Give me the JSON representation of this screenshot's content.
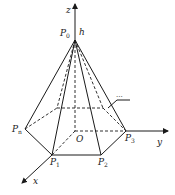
{
  "diagram": {
    "type": "3d-pyramid-coordinate",
    "axes": {
      "x": "x",
      "y": "y",
      "z": "z"
    },
    "points": {
      "apex": {
        "name": "P",
        "sub": "0"
      },
      "origin": "O",
      "base": [
        {
          "name": "P",
          "sub": "1"
        },
        {
          "name": "P",
          "sub": "2"
        },
        {
          "name": "P",
          "sub": "3"
        },
        {
          "name": "P",
          "sub": "n"
        }
      ]
    },
    "height_label": "h",
    "ellipsis_label": "...",
    "colors": {
      "stroke": "#1a1a1a",
      "background": "#ffffff"
    }
  }
}
